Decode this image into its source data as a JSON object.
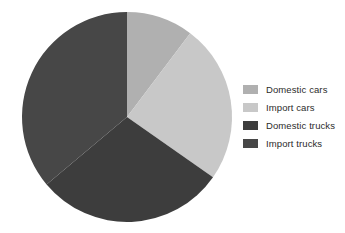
{
  "chart_data": {
    "type": "pie",
    "title": "",
    "subtitle": "",
    "xlabel": "",
    "ylabel": "",
    "grid": false,
    "legend_position": "right",
    "start_angle_deg": 0,
    "direction": "clockwise",
    "center": {
      "x": 127,
      "y": 117
    },
    "radius": 105,
    "categories": [
      "Domestic cars",
      "Import cars",
      "Domestic trucks",
      "Import trucks"
    ],
    "values": [
      10.3,
      24.4,
      29.2,
      36.1
    ],
    "units": "percent",
    "colors": [
      "#b0b0b0",
      "#c8c8c8",
      "#3d3d3d",
      "#474747"
    ],
    "slices": [
      {
        "label": "Domestic cars",
        "value": 10.3,
        "color": "#b0b0b0",
        "start_angle_deg": 0,
        "end_angle_deg": 37
      },
      {
        "label": "Import cars",
        "value": 24.4,
        "color": "#c8c8c8",
        "start_angle_deg": 37,
        "end_angle_deg": 125
      },
      {
        "label": "Domestic trucks",
        "value": 29.2,
        "color": "#3d3d3d",
        "start_angle_deg": 125,
        "end_angle_deg": 230
      },
      {
        "label": "Import trucks",
        "value": 36.1,
        "color": "#474747",
        "start_angle_deg": 230,
        "end_angle_deg": 360
      }
    ],
    "annotations": []
  },
  "legend": {
    "items": [
      {
        "label": "Domestic cars",
        "color": "#b0b0b0"
      },
      {
        "label": "Import cars",
        "color": "#c8c8c8"
      },
      {
        "label": "Domestic trucks",
        "color": "#3d3d3d"
      },
      {
        "label": "Import trucks",
        "color": "#474747"
      }
    ]
  },
  "canvas": {
    "background": "#ffffff"
  }
}
